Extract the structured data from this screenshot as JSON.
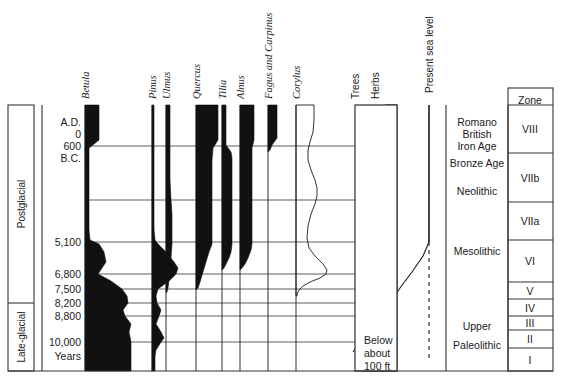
{
  "figure": {
    "type": "pollen-diagram",
    "baseline_year_label": "Years",
    "sea_level_note": [
      "Below",
      "about",
      "100 ft"
    ]
  },
  "period_column": {
    "name": "period-column",
    "items": [
      {
        "label": "Postglacial",
        "from_y": 105,
        "to_y": 303
      },
      {
        "label": "Late-glacial",
        "from_y": 303,
        "to_y": 371
      }
    ]
  },
  "time_axis": {
    "name": "time-axis",
    "ticks": [
      {
        "label": "A.D.",
        "y": 122,
        "gridline": false
      },
      {
        "label": "0",
        "y": 134,
        "gridline": false
      },
      {
        "label": "600",
        "y": 146,
        "gridline": true
      },
      {
        "label": "B.C.",
        "y": 158,
        "gridline": false
      },
      {
        "label": "",
        "y": 200,
        "gridline": true
      },
      {
        "label": "5,100",
        "y": 242,
        "gridline": true
      },
      {
        "label": "6,800",
        "y": 274,
        "gridline": true
      },
      {
        "label": "7,500",
        "y": 289,
        "gridline": true
      },
      {
        "label": "8,200",
        "y": 303,
        "gridline": true
      },
      {
        "label": "8,800",
        "y": 316,
        "gridline": true
      },
      {
        "label": "10,000",
        "y": 342,
        "gridline": true
      },
      {
        "label": "Years",
        "y": 356,
        "gridline": false
      }
    ]
  },
  "taxa": {
    "name": "taxa-curves",
    "style_note": "solid black silhouettes, baseline at left of each column",
    "items": [
      {
        "label": "Betula",
        "italic": true,
        "x": 85,
        "filled": true,
        "profile": [
          [
            105,
            14
          ],
          [
            118,
            14
          ],
          [
            140,
            14
          ],
          [
            148,
            4
          ],
          [
            200,
            4
          ],
          [
            230,
            4
          ],
          [
            240,
            5
          ],
          [
            244,
            14
          ],
          [
            252,
            19
          ],
          [
            262,
            21
          ],
          [
            268,
            17
          ],
          [
            274,
            13
          ],
          [
            281,
            26
          ],
          [
            289,
            37
          ],
          [
            296,
            42
          ],
          [
            303,
            43
          ],
          [
            310,
            38
          ],
          [
            316,
            40
          ],
          [
            324,
            46
          ],
          [
            332,
            44
          ],
          [
            342,
            46
          ],
          [
            356,
            46
          ],
          [
            371,
            46
          ]
        ]
      },
      {
        "label": "Pinus",
        "italic": true,
        "x": 152,
        "filled": true,
        "profile": [
          [
            105,
            2
          ],
          [
            150,
            2
          ],
          [
            200,
            2
          ],
          [
            230,
            2
          ],
          [
            240,
            3
          ],
          [
            244,
            6
          ],
          [
            252,
            14
          ],
          [
            262,
            22
          ],
          [
            268,
            26
          ],
          [
            274,
            24
          ],
          [
            281,
            17
          ],
          [
            286,
            10
          ],
          [
            289,
            6
          ],
          [
            296,
            4
          ],
          [
            303,
            5
          ],
          [
            310,
            9
          ],
          [
            316,
            7
          ],
          [
            324,
            4
          ],
          [
            332,
            9
          ],
          [
            338,
            12
          ],
          [
            342,
            9
          ],
          [
            350,
            4
          ],
          [
            356,
            3
          ],
          [
            371,
            3
          ]
        ]
      },
      {
        "label": "Ulmus",
        "italic": true,
        "x": 166,
        "filled": true,
        "profile": [
          [
            105,
            4
          ],
          [
            140,
            4
          ],
          [
            180,
            4
          ],
          [
            200,
            5
          ],
          [
            215,
            6
          ],
          [
            230,
            6
          ],
          [
            244,
            6
          ],
          [
            258,
            5
          ],
          [
            270,
            4
          ],
          [
            280,
            3
          ],
          [
            288,
            2
          ],
          [
            292,
            1
          ],
          [
            293,
            0
          ]
        ]
      },
      {
        "label": "Quercus",
        "italic": true,
        "x": 196,
        "filled": true,
        "profile": [
          [
            105,
            22
          ],
          [
            130,
            22
          ],
          [
            140,
            22
          ],
          [
            148,
            17
          ],
          [
            160,
            16
          ],
          [
            200,
            16
          ],
          [
            230,
            16
          ],
          [
            244,
            16
          ],
          [
            252,
            13
          ],
          [
            262,
            10
          ],
          [
            272,
            7
          ],
          [
            282,
            4
          ],
          [
            288,
            2
          ],
          [
            290,
            0
          ]
        ]
      },
      {
        "label": "Tilia",
        "italic": true,
        "x": 222,
        "filled": true,
        "profile": [
          [
            105,
            4
          ],
          [
            140,
            4
          ],
          [
            145,
            4
          ],
          [
            152,
            9
          ],
          [
            158,
            10
          ],
          [
            200,
            10
          ],
          [
            230,
            10
          ],
          [
            244,
            10
          ],
          [
            252,
            9
          ],
          [
            258,
            7
          ],
          [
            264,
            4
          ],
          [
            268,
            2
          ],
          [
            270,
            0
          ]
        ]
      },
      {
        "label": "Alnus",
        "italic": true,
        "x": 240,
        "filled": true,
        "profile": [
          [
            105,
            14
          ],
          [
            130,
            14
          ],
          [
            140,
            14
          ],
          [
            148,
            12
          ],
          [
            160,
            12
          ],
          [
            200,
            12
          ],
          [
            230,
            12
          ],
          [
            244,
            12
          ],
          [
            250,
            11
          ],
          [
            258,
            8
          ],
          [
            264,
            5
          ],
          [
            268,
            2
          ],
          [
            270,
            0
          ]
        ]
      },
      {
        "label": "Fagus and Carpinus",
        "italic": true,
        "x": 268,
        "filled": true,
        "profile": [
          [
            105,
            9
          ],
          [
            130,
            9
          ],
          [
            138,
            9
          ],
          [
            145,
            4
          ],
          [
            150,
            2
          ],
          [
            152,
            0
          ]
        ]
      },
      {
        "label": "Corylus",
        "italic": true,
        "x": 296,
        "filled": false,
        "profile": [
          [
            105,
            18
          ],
          [
            120,
            18
          ],
          [
            132,
            17
          ],
          [
            142,
            14
          ],
          [
            150,
            12
          ],
          [
            160,
            12
          ],
          [
            170,
            15
          ],
          [
            180,
            19
          ],
          [
            188,
            21
          ],
          [
            196,
            21
          ],
          [
            204,
            19
          ],
          [
            214,
            15
          ],
          [
            226,
            12
          ],
          [
            238,
            11
          ],
          [
            248,
            13
          ],
          [
            256,
            19
          ],
          [
            264,
            27
          ],
          [
            270,
            31
          ],
          [
            274,
            30
          ],
          [
            278,
            24
          ],
          [
            282,
            14
          ],
          [
            286,
            7
          ],
          [
            289,
            4
          ],
          [
            292,
            2
          ],
          [
            294,
            1
          ],
          [
            296,
            1
          ]
        ]
      }
    ]
  },
  "summary_panel": {
    "name": "trees-herbs-panel",
    "trees_label": "Trees",
    "herbs_label": "Herbs",
    "x_left": 355,
    "x_right": 397,
    "boundary": [
      [
        105,
        30
      ],
      [
        130,
        31
      ],
      [
        160,
        33
      ],
      [
        190,
        35
      ],
      [
        215,
        36
      ],
      [
        240,
        37
      ],
      [
        262,
        38
      ],
      [
        278,
        38
      ],
      [
        286,
        35
      ],
      [
        291,
        31
      ],
      [
        296,
        29
      ],
      [
        300,
        31
      ],
      [
        306,
        33
      ],
      [
        311,
        31
      ],
      [
        316,
        25
      ],
      [
        322,
        19
      ],
      [
        328,
        15
      ],
      [
        334,
        14
      ],
      [
        340,
        13
      ],
      [
        348,
        10
      ],
      [
        356,
        8
      ],
      [
        364,
        7
      ],
      [
        371,
        7
      ]
    ]
  },
  "sea_level": {
    "name": "sea-level-panel",
    "label": "Present sea level",
    "present_x": 429,
    "curve": [
      [
        242,
        429
      ],
      [
        256,
        423
      ],
      [
        272,
        412
      ],
      [
        288,
        400
      ],
      [
        304,
        389
      ],
      [
        318,
        378
      ],
      [
        330,
        369
      ],
      [
        340,
        362
      ],
      [
        348,
        356
      ],
      [
        352,
        353
      ]
    ],
    "note_lines": [
      "Below",
      "about",
      "100 ft"
    ]
  },
  "culture_column": {
    "name": "culture-column",
    "items": [
      {
        "lines": [
          "Romano",
          "British",
          "Iron  Age"
        ],
        "y": 126
      },
      {
        "lines": [
          "Bronze  Age"
        ],
        "y": 167
      },
      {
        "lines": [
          "Neolithic"
        ],
        "y": 195
      },
      {
        "lines": [
          "Mesolithic"
        ],
        "y": 255
      },
      {
        "lines": [
          "Upper"
        ],
        "y": 330
      },
      {
        "lines": [
          "Paleolithic"
        ],
        "y": 349
      }
    ]
  },
  "zone_column": {
    "name": "zone-column",
    "header": "Zone",
    "rows": [
      {
        "label": "VIII",
        "top": 105,
        "bottom": 153
      },
      {
        "label": "VIIb",
        "top": 153,
        "bottom": 202
      },
      {
        "label": "VIIa",
        "top": 202,
        "bottom": 240
      },
      {
        "label": "VI",
        "top": 240,
        "bottom": 282
      },
      {
        "label": "V",
        "top": 282,
        "bottom": 299
      },
      {
        "label": "IV",
        "top": 299,
        "bottom": 316
      },
      {
        "label": "III",
        "top": 316,
        "bottom": 330
      },
      {
        "label": "II",
        "top": 330,
        "bottom": 348
      },
      {
        "label": "I",
        "top": 348,
        "bottom": 371
      }
    ]
  },
  "colors": {
    "ink": "#1a1a1a",
    "fill": "#111111",
    "grid": "#4d4d4d",
    "frame": "#333333",
    "hatch": "#333333"
  }
}
